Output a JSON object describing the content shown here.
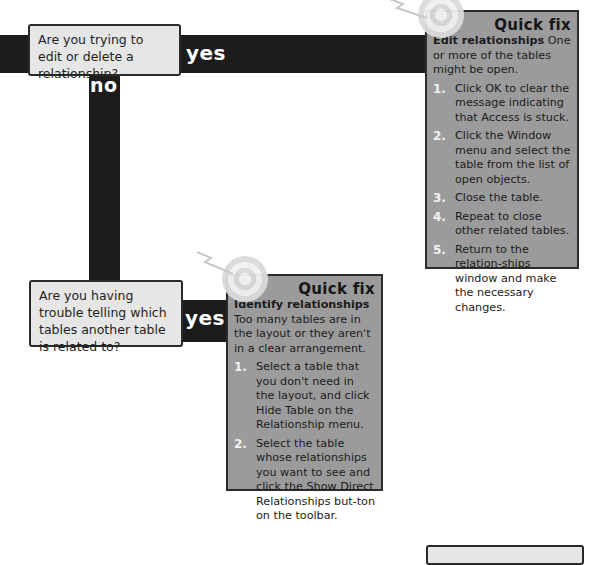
{
  "flow": {
    "question1": "Are you trying to edit or delete a relationship?",
    "question2": "Are you having trouble telling which tables another table is related to?",
    "yes_label": "yes",
    "no_label": "no"
  },
  "quick_fix_1": {
    "title": "Quick fix",
    "heading": "Edit relationships",
    "intro": "One or more of the tables might be open.",
    "steps": [
      {
        "num": "1.",
        "text": "Click OK to clear the message indicating that Access is stuck."
      },
      {
        "num": "2.",
        "text": "Click the Window menu and select the table from the list of open objects."
      },
      {
        "num": "3.",
        "text": "Close the table."
      },
      {
        "num": "4.",
        "text": "Repeat to close other related tables."
      },
      {
        "num": "5.",
        "text": "Return to the relation-ships window and make the necessary changes."
      }
    ]
  },
  "quick_fix_2": {
    "title": "Quick fix",
    "heading": "Identify relationships",
    "intro": "Too many tables are in the layout or they aren't in a clear arrangement.",
    "steps": [
      {
        "num": "1.",
        "text": "Select a table that you don't need in the layout, and click Hide Table on the Relationship menu."
      },
      {
        "num": "2.",
        "text": "Select the table whose relationships you want to see and click the Show Direct Relationships but-ton on the toolbar."
      }
    ]
  },
  "colors": {
    "connector": "#1c1c1c",
    "question_fill": "#e6e6e6",
    "fix_fill": "#9b9b9b",
    "step_number": "#f2f2f2"
  }
}
